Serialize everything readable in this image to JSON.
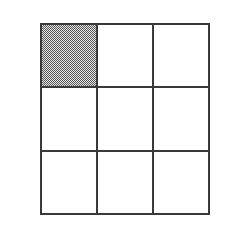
{
  "figure": {
    "type": "grid-diagram",
    "title": "",
    "background_color": "#ffffff",
    "canvas": {
      "width": 239,
      "height": 231
    },
    "grid": {
      "rows": 3,
      "columns": 3,
      "left": 40,
      "top": 23,
      "width": 170,
      "height": 192,
      "line_color": "#3a3a3a",
      "line_width_px": 2,
      "cell_fill_color": "#ffffff",
      "shaded_fill_pattern": "checkerboard-50-percent",
      "shaded_fill_dark_color": "#555555",
      "shaded_fill_light_color": "#e8e8e8",
      "shaded_cells_count": 1,
      "total_cells_count": 9,
      "fraction_shaded": "1/9"
    },
    "cells": [
      {
        "row": 0,
        "column": 0,
        "label": "cell-r1c1",
        "shaded": true
      },
      {
        "row": 0,
        "column": 1,
        "label": "cell-r1c2",
        "shaded": false
      },
      {
        "row": 0,
        "column": 2,
        "label": "cell-r1c3",
        "shaded": false
      },
      {
        "row": 1,
        "column": 0,
        "label": "cell-r2c1",
        "shaded": false
      },
      {
        "row": 1,
        "column": 1,
        "label": "cell-r2c2",
        "shaded": false
      },
      {
        "row": 1,
        "column": 2,
        "label": "cell-r2c3",
        "shaded": false
      },
      {
        "row": 2,
        "column": 0,
        "label": "cell-r3c1",
        "shaded": false
      },
      {
        "row": 2,
        "column": 1,
        "label": "cell-r3c2",
        "shaded": false
      },
      {
        "row": 2,
        "column": 2,
        "label": "cell-r3c3",
        "shaded": false
      }
    ]
  }
}
